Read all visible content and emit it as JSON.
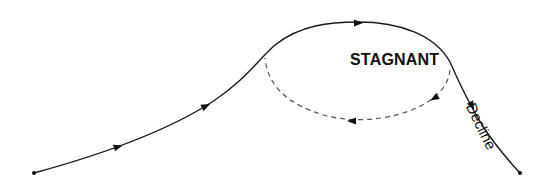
{
  "diagram": {
    "type": "lifecycle-curve",
    "labels": {
      "stagnant": "STAGNANT",
      "decline": "Decline"
    },
    "colors": {
      "line": "#1a1a1a",
      "loop": "#555555",
      "background": "#ffffff"
    },
    "elements": [
      {
        "id": "growth-curve",
        "style": "solid",
        "direction": "rising"
      },
      {
        "id": "peak-arc",
        "style": "solid",
        "direction": "rightward"
      },
      {
        "id": "stagnant-loop",
        "style": "dashed",
        "direction": "counterclockwise-return"
      },
      {
        "id": "decline-curve",
        "style": "solid",
        "direction": "falling"
      }
    ]
  }
}
